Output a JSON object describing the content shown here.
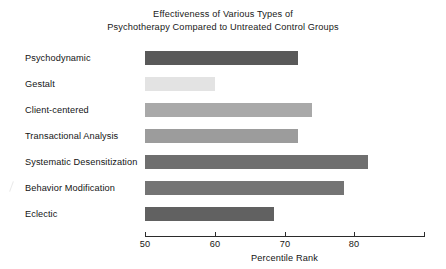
{
  "chart_data": {
    "type": "bar",
    "orientation": "horizontal",
    "title": "Effectiveness of Various Types of Psychotherapy Compared to Untreated Control Groups",
    "title_lines": [
      "Effectiveness of Various Types of",
      "Psychotherapy Compared to Untreated Control Groups"
    ],
    "categories": [
      "Psychodynamic",
      "Gestalt",
      "Client-centered",
      "Transactional Analysis",
      "Systematic Desensitization",
      "Behavior Modification",
      "Eclectic"
    ],
    "values": [
      72,
      60,
      74,
      72,
      82,
      78.5,
      68.5
    ],
    "bar_colors": [
      "#595959",
      "#e3e3e3",
      "#a9a9a9",
      "#9c9c9c",
      "#6f6f6f",
      "#747474",
      "#616161"
    ],
    "xlabel": "Percentile Rank",
    "ylabel": "",
    "xlim": [
      50,
      90
    ],
    "xticks": [
      50,
      60,
      70,
      80,
      90
    ],
    "xtick_labels": [
      "50",
      "60",
      "70",
      "80",
      ""
    ],
    "grid": false,
    "legend": false,
    "baseline": 50
  }
}
